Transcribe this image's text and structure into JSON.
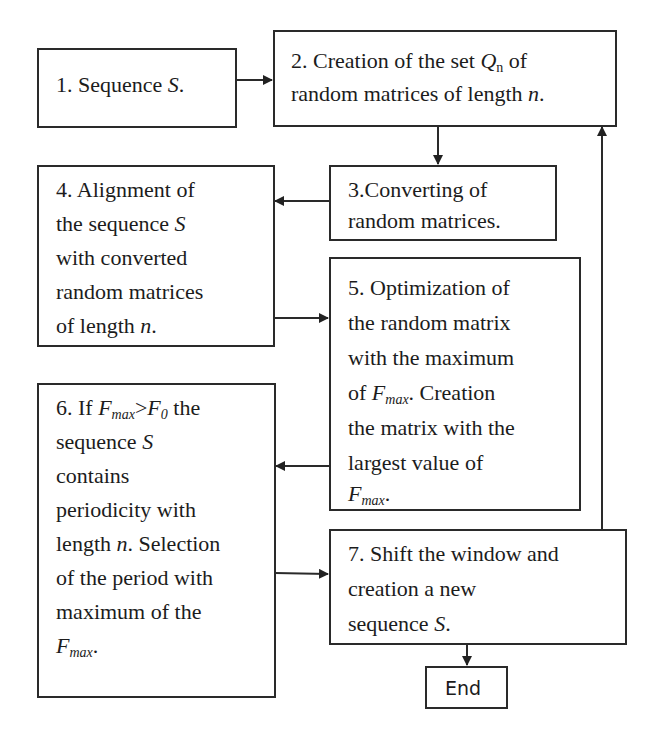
{
  "diagram": {
    "type": "flowchart",
    "nodes": [
      {
        "id": "1",
        "lines": [
          "1. Sequence S."
        ]
      },
      {
        "id": "2",
        "lines": [
          "2. Creation of the set Qn of",
          "random matrices of length n."
        ]
      },
      {
        "id": "3",
        "lines": [
          "3.Converting of",
          "random matrices."
        ]
      },
      {
        "id": "4",
        "lines": [
          "4. Alignment of",
          "the sequence S",
          "with converted",
          "random matrices",
          "of length n."
        ]
      },
      {
        "id": "5",
        "lines": [
          "5. Optimization of",
          "the random matrix",
          "with the maximum",
          "of Fmax. Creation",
          "the matrix with the",
          "largest value of",
          "Fmax."
        ]
      },
      {
        "id": "6",
        "lines": [
          "6. If Fmax>F0 the",
          "sequence S",
          "contains",
          "periodicity with",
          "length n. Selection",
          "of the period with",
          "maximum of the",
          "Fmax."
        ]
      },
      {
        "id": "7",
        "lines": [
          "7. Shift the window and",
          "creation a new",
          "sequence S."
        ]
      },
      {
        "id": "end",
        "lines": [
          "End"
        ]
      }
    ],
    "edges": [
      {
        "from": "1",
        "to": "2"
      },
      {
        "from": "2",
        "to": "3"
      },
      {
        "from": "3",
        "to": "4"
      },
      {
        "from": "4",
        "to": "5"
      },
      {
        "from": "5",
        "to": "6"
      },
      {
        "from": "6",
        "to": "7"
      },
      {
        "from": "7",
        "to": "2"
      },
      {
        "from": "7",
        "to": "end"
      }
    ]
  },
  "text": {
    "n1": {
      "a": "1. Sequence ",
      "S": "S",
      "b": "."
    },
    "n2": {
      "l1a": "2. Creation of the set ",
      "Q": "Q",
      "sub": "n",
      "l1b": " of",
      "l2a": "random matrices of length ",
      "n": "n",
      "l2b": "."
    },
    "n3": {
      "l1": "3.Converting of",
      "l2": "random matrices."
    },
    "n4": {
      "l1": "4. Alignment of",
      "l2a": "the sequence ",
      "S": "S",
      "l3": "with converted",
      "l4": "random matrices",
      "l5a": "of length ",
      "n": "n",
      "l5b": "."
    },
    "n5": {
      "l1": "5. Optimization of",
      "l2": "the random matrix",
      "l3": "with the maximum",
      "l4a": "of ",
      "F": "F",
      "sub": "max",
      "l4b": ". Creation",
      "l5": "the matrix with the",
      "l6": "largest value of",
      "l7F": "F",
      "l7sub": "max",
      "l7b": "."
    },
    "n6": {
      "l1a": "6. If ",
      "F": "F",
      "sub": "max",
      "gt": ">",
      "F0": "F",
      "sub0": "0",
      "l1b": " the",
      "l2a": "sequence ",
      "S": "S",
      "l3": "contains",
      "l4": "periodicity with",
      "l5a": "length ",
      "n": "n",
      "l5b": ". Selection",
      "l6": "of the period with",
      "l7": "maximum of the",
      "l8F": "F",
      "l8sub": "max",
      "l8b": "."
    },
    "n7": {
      "l1": "7. Shift the window and",
      "l2": "creation a new",
      "l3a": "sequence ",
      "S": "S",
      "l3b": "."
    },
    "end": "End"
  }
}
